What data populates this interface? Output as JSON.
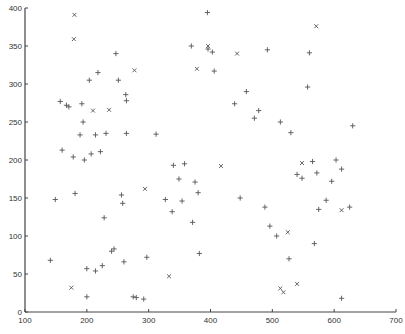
{
  "chart_data": {
    "type": "scatter",
    "title": "",
    "xlabel": "",
    "ylabel": "",
    "xlim": [
      100,
      700
    ],
    "ylim": [
      0,
      400
    ],
    "grid": false,
    "legend": null,
    "xticks": [
      100,
      200,
      300,
      400,
      500,
      600,
      700
    ],
    "yticks": [
      0,
      50,
      100,
      150,
      200,
      250,
      300,
      350,
      400
    ],
    "series": [
      {
        "name": "plus",
        "marker": "+",
        "color": "#555555",
        "points": [
          [
            141,
            68
          ],
          [
            149,
            148
          ],
          [
            157,
            277
          ],
          [
            160,
            213
          ],
          [
            167,
            272
          ],
          [
            171,
            270
          ],
          [
            178,
            204
          ],
          [
            181,
            156
          ],
          [
            189,
            233
          ],
          [
            192,
            274
          ],
          [
            194,
            250
          ],
          [
            196,
            200
          ],
          [
            200,
            57
          ],
          [
            200,
            20
          ],
          [
            204,
            305
          ],
          [
            207,
            208
          ],
          [
            214,
            233
          ],
          [
            214,
            54
          ],
          [
            218,
            315
          ],
          [
            222,
            211
          ],
          [
            225,
            61
          ],
          [
            228,
            124
          ],
          [
            231,
            235
          ],
          [
            240,
            80
          ],
          [
            244,
            83
          ],
          [
            247,
            340
          ],
          [
            251,
            305
          ],
          [
            256,
            154
          ],
          [
            258,
            143
          ],
          [
            260,
            66
          ],
          [
            263,
            286
          ],
          [
            264,
            278
          ],
          [
            264,
            235
          ],
          [
            275,
            20
          ],
          [
            280,
            19
          ],
          [
            292,
            17
          ],
          [
            297,
            72
          ],
          [
            312,
            234
          ],
          [
            327,
            148
          ],
          [
            338,
            132
          ],
          [
            340,
            193
          ],
          [
            349,
            175
          ],
          [
            354,
            146
          ],
          [
            358,
            195
          ],
          [
            371,
            118
          ],
          [
            375,
            171
          ],
          [
            380,
            157
          ],
          [
            382,
            77
          ],
          [
            396,
            346
          ],
          [
            403,
            342
          ],
          [
            406,
            317
          ],
          [
            439,
            274
          ],
          [
            448,
            150
          ],
          [
            458,
            290
          ],
          [
            471,
            255
          ],
          [
            478,
            265
          ],
          [
            488,
            138
          ],
          [
            492,
            345
          ],
          [
            496,
            113
          ],
          [
            507,
            100
          ],
          [
            513,
            250
          ],
          [
            527,
            70
          ],
          [
            530,
            236
          ],
          [
            540,
            181
          ],
          [
            548,
            176
          ],
          [
            557,
            296
          ],
          [
            560,
            341
          ],
          [
            565,
            198
          ],
          [
            568,
            90
          ],
          [
            572,
            183
          ],
          [
            575,
            135
          ],
          [
            587,
            147
          ],
          [
            596,
            172
          ],
          [
            603,
            200
          ],
          [
            612,
            188
          ],
          [
            630,
            245
          ],
          [
            612,
            18
          ],
          [
            625,
            138
          ],
          [
            395,
            394
          ],
          [
            369,
            350
          ]
        ]
      },
      {
        "name": "x",
        "marker": "x",
        "color": "#555555",
        "points": [
          [
            175,
            32
          ],
          [
            179,
            359
          ],
          [
            180,
            391
          ],
          [
            210,
            265
          ],
          [
            236,
            266
          ],
          [
            277,
            318
          ],
          [
            294,
            162
          ],
          [
            333,
            47
          ],
          [
            378,
            320
          ],
          [
            396,
            350
          ],
          [
            417,
            192
          ],
          [
            443,
            340
          ],
          [
            513,
            31
          ],
          [
            518,
            26
          ],
          [
            525,
            105
          ],
          [
            540,
            37
          ],
          [
            571,
            376
          ],
          [
            612,
            134
          ],
          [
            548,
            196
          ]
        ]
      }
    ]
  }
}
